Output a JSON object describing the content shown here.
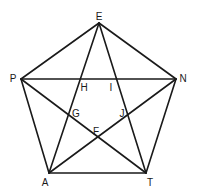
{
  "diagram": {
    "title": "",
    "vertices": [
      {
        "name": "E",
        "x": 99,
        "y": 23,
        "lx": 99,
        "ly": 20
      },
      {
        "name": "P",
        "x": 21,
        "y": 79,
        "lx": 13,
        "ly": 82
      },
      {
        "name": "N",
        "x": 176,
        "y": 79,
        "lx": 183,
        "ly": 82
      },
      {
        "name": "A",
        "x": 49,
        "y": 173,
        "lx": 45,
        "ly": 186
      },
      {
        "name": "T",
        "x": 146,
        "y": 173,
        "lx": 150,
        "ly": 186
      }
    ],
    "intersections": [
      {
        "name": "H",
        "lx": 84,
        "ly": 91
      },
      {
        "name": "I",
        "lx": 111,
        "ly": 91
      },
      {
        "name": "G",
        "lx": 76,
        "ly": 117
      },
      {
        "name": "J",
        "lx": 122,
        "ly": 117
      },
      {
        "name": "F",
        "lx": 96,
        "ly": 135
      }
    ],
    "segments": [
      [
        "E",
        "P"
      ],
      [
        "E",
        "N"
      ],
      [
        "P",
        "A"
      ],
      [
        "N",
        "T"
      ],
      [
        "A",
        "T"
      ],
      [
        "P",
        "N"
      ],
      [
        "E",
        "A"
      ],
      [
        "E",
        "T"
      ],
      [
        "P",
        "T"
      ],
      [
        "N",
        "A"
      ]
    ]
  }
}
